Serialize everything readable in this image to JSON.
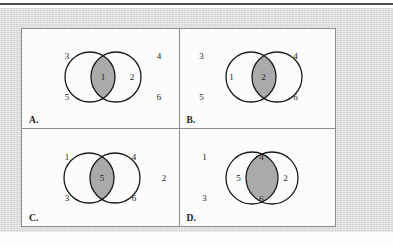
{
  "figure": {
    "colors": {
      "backdrop": "#dedede",
      "panel_fill": "#fcfcfc",
      "panel_border": "#8d8d8f",
      "circle_stroke": "#1a1a1a",
      "shade_fill": "#aaaaaa",
      "top_rule": "#4b4b4d",
      "text": "#232323"
    },
    "quadrants": [
      {
        "id": "a",
        "label": "A.",
        "overlap": "narrow",
        "shaded_region": "intersection",
        "numbers": [
          {
            "value": "3",
            "region": "left-circle-top",
            "x": 45,
            "y": 27
          },
          {
            "value": "5",
            "region": "left-circle-bottom",
            "x": 45,
            "y": 68
          },
          {
            "value": "1",
            "region": "intersection",
            "x": 81,
            "y": 48
          },
          {
            "value": "2",
            "region": "right-circle",
            "x": 110,
            "y": 48
          },
          {
            "value": "4",
            "region": "outside-top-right",
            "x": 137,
            "y": 27
          },
          {
            "value": "6",
            "region": "outside-bottom-right",
            "x": 137,
            "y": 68
          }
        ]
      },
      {
        "id": "b",
        "label": "B.",
        "overlap": "narrow",
        "shaded_region": "intersection",
        "numbers": [
          {
            "value": "3",
            "region": "outside-top-left",
            "x": 22,
            "y": 27
          },
          {
            "value": "5",
            "region": "outside-bottom-left",
            "x": 22,
            "y": 68
          },
          {
            "value": "1",
            "region": "left-circle",
            "x": 52,
            "y": 48
          },
          {
            "value": "2",
            "region": "intersection",
            "x": 84,
            "y": 48
          },
          {
            "value": "4",
            "region": "right-circle-top",
            "x": 116,
            "y": 27
          },
          {
            "value": "6",
            "region": "right-circle-bottom",
            "x": 116,
            "y": 68
          }
        ]
      },
      {
        "id": "c",
        "label": "C.",
        "overlap": "narrow",
        "shaded_region": "intersection",
        "numbers": [
          {
            "value": "1",
            "region": "left-circle-top",
            "x": 45,
            "y": 28
          },
          {
            "value": "3",
            "region": "left-circle-bottom",
            "x": 45,
            "y": 69
          },
          {
            "value": "5",
            "region": "intersection",
            "x": 80,
            "y": 49
          },
          {
            "value": "4",
            "region": "right-circle-top",
            "x": 112,
            "y": 28
          },
          {
            "value": "6",
            "region": "right-circle-bottom",
            "x": 112,
            "y": 69
          },
          {
            "value": "2",
            "region": "outside-right",
            "x": 142,
            "y": 49
          }
        ]
      },
      {
        "id": "d",
        "label": "D.",
        "overlap": "wide",
        "shaded_region": "intersection",
        "numbers": [
          {
            "value": "1",
            "region": "outside-top-left",
            "x": 25,
            "y": 28
          },
          {
            "value": "3",
            "region": "outside-bottom-left",
            "x": 25,
            "y": 69
          },
          {
            "value": "5",
            "region": "left-circle-crescent",
            "x": 59,
            "y": 49
          },
          {
            "value": "4",
            "region": "intersection-top",
            "x": 82,
            "y": 28
          },
          {
            "value": "6",
            "region": "intersection-bottom",
            "x": 82,
            "y": 70
          },
          {
            "value": "2",
            "region": "right-circle-crescent",
            "x": 106,
            "y": 49
          }
        ]
      }
    ]
  }
}
